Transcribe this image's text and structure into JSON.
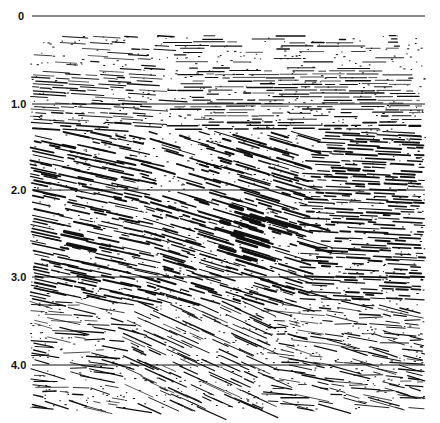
{
  "figure": {
    "type": "seismic-reflection-section",
    "background": "#ffffff",
    "ink": "#111111",
    "time_axis": {
      "unit": "s (two-way time)",
      "ticks": [
        {
          "label": "0",
          "value": 0,
          "y": 16
        },
        {
          "label": "1.0",
          "value": 1.0,
          "y": 104
        },
        {
          "label": "2.0",
          "value": 2.0,
          "y": 190
        },
        {
          "label": "3.0",
          "value": 3.0,
          "y": 277
        },
        {
          "label": "4.0",
          "value": 4.0,
          "y": 365
        }
      ],
      "line_x_start": 32,
      "line_x_end": 425
    },
    "data_extent": {
      "x0": 30,
      "x1": 425,
      "y0": 36,
      "y1": 410
    }
  }
}
